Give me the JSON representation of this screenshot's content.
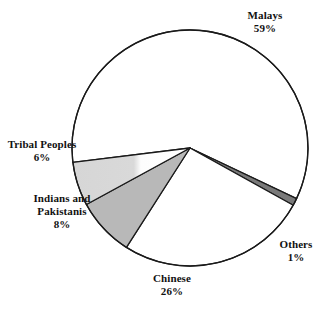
{
  "chart_data": {
    "type": "pie",
    "title": "",
    "subtitle": "",
    "xlabel": "",
    "ylabel": "",
    "legend_position": "none",
    "grid": false,
    "value_unit": "%",
    "categories": [
      "Malays",
      "Others",
      "Chinese",
      "Indians and Pakistanis",
      "Tribal Peoples"
    ],
    "values": [
      59,
      1,
      26,
      8,
      6
    ],
    "slices": [
      {
        "id": "malays",
        "label": "Malays",
        "value": 59,
        "value_text": "59%",
        "fill": "#ffffff",
        "stroke": "#1a1a1a",
        "label_lines": [
          "Malays",
          "59%"
        ]
      },
      {
        "id": "others",
        "label": "Others",
        "value": 1,
        "value_text": "1%",
        "fill": "#7a7a7a",
        "stroke": "#1a1a1a",
        "label_lines": [
          "Others",
          "1%"
        ]
      },
      {
        "id": "chinese",
        "label": "Chinese",
        "value": 26,
        "value_text": "26%",
        "fill": "#ffffff",
        "stroke": "#1a1a1a",
        "label_lines": [
          "Chinese",
          "26%"
        ]
      },
      {
        "id": "indians-and-pakistanis",
        "label": "Indians and Pakistanis",
        "value": 8,
        "value_text": "8%",
        "fill": "#b8b8b8",
        "stroke": "#1a1a1a",
        "label_lines": [
          "Indians and",
          "Pakistanis",
          "8%"
        ]
      },
      {
        "id": "tribal-peoples",
        "label": "Tribal Peoples",
        "value": 6,
        "value_text": "6%",
        "fill": "#d9d9d9",
        "stroke": "#1a1a1a",
        "label_lines": [
          "Tribal Peoples",
          "6%"
        ]
      }
    ],
    "geometry": {
      "center_x": 190,
      "center_y": 148,
      "radius": 118,
      "start_angle_deg": 173,
      "direction": "clockwise"
    },
    "colors": {
      "background": "#ffffff",
      "outline": "#1a1a1a",
      "text": "#111111",
      "fill_light": "#d9d9d9",
      "fill_medium": "#b8b8b8",
      "fill_dark": "#7a7a7a",
      "fill_white": "#ffffff"
    }
  },
  "labels": {
    "malays": {
      "name": "Malays",
      "value": "59%"
    },
    "tribal": {
      "name": "Tribal Peoples",
      "value": "6%"
    },
    "indians": {
      "name_1": "Indians and",
      "name_2": "Pakistanis",
      "value": "8%"
    },
    "others": {
      "name": "Others",
      "value": "1%"
    },
    "chinese": {
      "name": "Chinese",
      "value": "26%"
    }
  }
}
